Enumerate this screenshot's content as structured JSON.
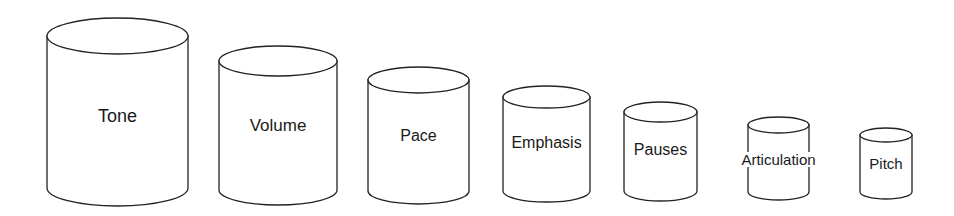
{
  "diagram": {
    "title": "",
    "cylinders": [
      {
        "label": "Tone",
        "left": 47,
        "right": 188,
        "top": 36,
        "ry": 18,
        "bottom": 188,
        "label_y": 117,
        "font_size": 18,
        "label_overlaps": false
      },
      {
        "label": "Volume",
        "left": 219,
        "right": 337,
        "top": 61,
        "ry": 15,
        "bottom": 190,
        "label_y": 127,
        "font_size": 17,
        "label_overlaps": false
      },
      {
        "label": "Pace",
        "left": 368,
        "right": 469,
        "top": 80,
        "ry": 13,
        "bottom": 191,
        "label_y": 137,
        "font_size": 16,
        "label_overlaps": false
      },
      {
        "label": "Emphasis",
        "left": 503,
        "right": 590,
        "top": 97,
        "ry": 11,
        "bottom": 191,
        "label_y": 144,
        "font_size": 16,
        "label_overlaps": true
      },
      {
        "label": "Pauses",
        "left": 624,
        "right": 697,
        "top": 112,
        "ry": 10,
        "bottom": 191,
        "label_y": 151,
        "font_size": 16,
        "label_overlaps": true
      },
      {
        "label": "Articulation",
        "left": 748,
        "right": 809,
        "top": 125,
        "ry": 8,
        "bottom": 192,
        "label_y": 161,
        "font_size": 15,
        "label_overlaps": true
      },
      {
        "label": "Pitch",
        "left": 860,
        "right": 912,
        "top": 135,
        "ry": 7,
        "bottom": 192,
        "label_y": 165,
        "font_size": 15,
        "label_overlaps": true
      }
    ]
  },
  "colors": {
    "stroke": "#222222",
    "fill": "#ffffff",
    "text": "#1a1a1a"
  }
}
